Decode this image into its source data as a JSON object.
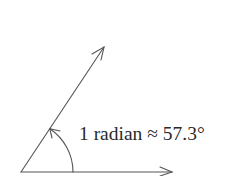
{
  "diagram": {
    "title": "",
    "label": "1 radian ≈ 57.3°",
    "colors": {
      "stroke": "#555555",
      "text": "#2a2a2a",
      "background": "#ffffff"
    },
    "geometry": {
      "origin": [
        21,
        172
      ],
      "horizontal_ray_end": [
        172,
        172
      ],
      "inclined_ray_end": [
        104,
        47
      ],
      "arc_radius": 52,
      "angle_degrees": 57.3
    },
    "elements": [
      {
        "name": "horizontal-ray",
        "type": "arrow"
      },
      {
        "name": "inclined-ray",
        "type": "arrow"
      },
      {
        "name": "angle-arc",
        "type": "arc-arrow"
      }
    ]
  }
}
